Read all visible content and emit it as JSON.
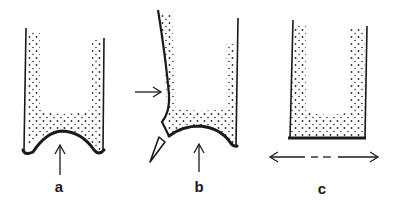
{
  "figures": [
    {
      "id": "a",
      "label": "a",
      "description": "tube with concave curved base, arrow pointing up"
    },
    {
      "id": "b",
      "label": "b",
      "description": "tube with curved left wall, concave base, side arrow and triangular notch"
    },
    {
      "id": "c",
      "label": "c",
      "description": "tube with flat base, double-headed horizontal dashed arrow"
    }
  ],
  "colors": {
    "ink": "#1a1a1a",
    "stipple": "#2a2a2a",
    "background": "#ffffff"
  }
}
